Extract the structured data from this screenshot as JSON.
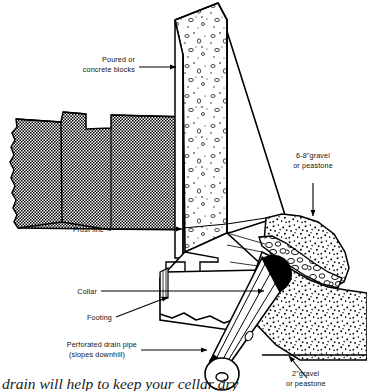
{
  "figure": {
    "caption": "drain will help to keep your cellar dry"
  },
  "colors": {
    "ink": "#000000",
    "paper": "#ffffff",
    "soil": "#000000",
    "gravel": "#000000",
    "pipe_dark": "#000000"
  },
  "labels": {
    "wall": {
      "line1": "Poured or",
      "line2": "concrete blocks"
    },
    "frost_line": {
      "line1": "Frost line"
    },
    "collar": {
      "line1": "Collar"
    },
    "footing": {
      "line1": "Footing"
    },
    "drain_pipe": {
      "line1": "Perforated drain pipe",
      "line2": "(slopes downhill)"
    },
    "upper_gravel": {
      "line1": "6-8\"gravel",
      "line2": "or peastone"
    },
    "lower_gravel": {
      "line1": "2\"gravel",
      "line2": "or peastone"
    }
  },
  "regions": {
    "soil": "earth-backfill-checker-hatch",
    "wall_front": "concrete-aggregate-speckle",
    "upper_gravel_bed": "coarse-stipple",
    "pebble_band": "drawn-pebble-outlines",
    "lower_gravel_bed": "coarse-stipple",
    "footing": "stepped-concrete-footing",
    "pipe": "perforated-cylindrical-drain-pipe"
  }
}
